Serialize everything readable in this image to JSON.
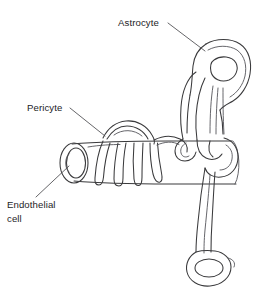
{
  "figure": {
    "type": "line-diagram",
    "background_color": "#ffffff",
    "line_color": "#3a3a3c",
    "text_color": "#1d1d1f"
  },
  "labels": {
    "astrocyte": "Astrocyte",
    "pericyte": "Pericyte",
    "endothelial_line1": "Endothelial",
    "endothelial_line2": "cell"
  },
  "structures": {
    "vessel_name": "endothelial-cell-vessel",
    "pericyte_name": "pericyte-cell",
    "astrocyte_name": "astrocyte-cell",
    "astrocyte_nucleus_name": "astrocyte-nucleus",
    "endfoot_nucleus_name": "astrocyte-endfoot-nucleus"
  }
}
